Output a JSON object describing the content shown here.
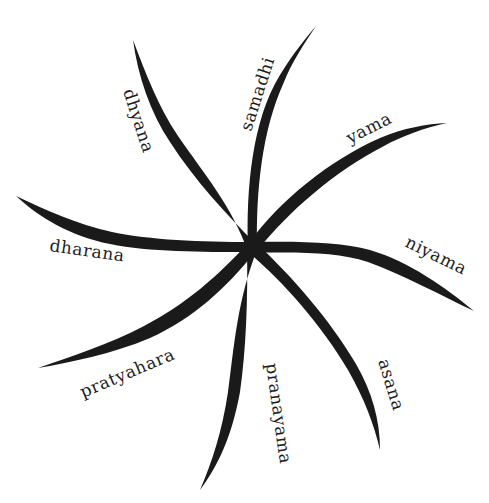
{
  "diagram": {
    "type": "radial-pinwheel",
    "colors": {
      "stroke": "#1a1a1a",
      "text": "#1e1e1e",
      "background": "#ffffff"
    },
    "center": [
      252,
      247
    ],
    "limbs": [
      {
        "label": "samadhi"
      },
      {
        "label": "yama"
      },
      {
        "label": "niyama"
      },
      {
        "label": "asana"
      },
      {
        "label": "pranayama"
      },
      {
        "label": "pratyahara"
      },
      {
        "label": "dharana"
      },
      {
        "label": "dhyana"
      }
    ]
  }
}
